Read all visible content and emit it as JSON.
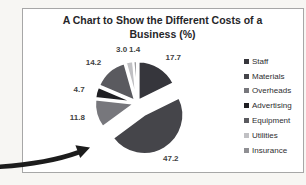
{
  "chart": {
    "title": "A Chart to Show the Different Costs of a Business (%)"
  },
  "chart_data": {
    "type": "pie",
    "title": "A Chart to Show the Different Costs of a Business (%)",
    "categories": [
      "Staff",
      "Materials",
      "Overheads",
      "Advertising",
      "Equipment",
      "Utilities",
      "Insurance"
    ],
    "values": [
      17.7,
      47.2,
      11.8,
      4.7,
      14.2,
      3.0,
      1.4
    ],
    "labels": [
      "17.7",
      "47.2",
      "11.8",
      "4.7",
      "14.2",
      "3.0",
      "1.4"
    ],
    "unit": "%",
    "colors": [
      "#36363c",
      "#45454a",
      "#77777c",
      "#1f1f23",
      "#5a5a5f",
      "#c0c0c3",
      "#8f8f93"
    ],
    "legend_position": "right",
    "start_angle": 0,
    "exploded_slice": "Materials",
    "style": "exploded-pie, white slice separators, grayscale print"
  },
  "annotation": {
    "arrow_color": "#1c1c1c",
    "arrow_meaning": "hand-drawn arrow pointing at exploded Materials slice"
  }
}
